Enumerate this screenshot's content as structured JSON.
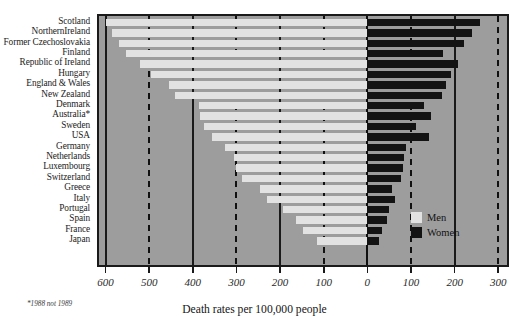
{
  "chart_data": {
    "type": "bar",
    "orientation": "horizontal-diverging",
    "title": "",
    "xlabel": "Death rates per 100,000 people",
    "ylabel": "",
    "footnote": "*1988 not 1989",
    "grid": true,
    "legend_position": "inside-right",
    "axis": {
      "tick_labels": [
        "600",
        "500",
        "400",
        "300",
        "200",
        "100",
        "0",
        "100",
        "200",
        "300"
      ],
      "tick_values": [
        -600,
        -500,
        -400,
        -300,
        -200,
        -100,
        0,
        100,
        200,
        300
      ],
      "xlim": [
        -615,
        320
      ],
      "zero_label": "0"
    },
    "categories": [
      "Scotland",
      "NorthernIreland",
      "Former Czechoslovakia",
      "Finland",
      "Republic of Ireland",
      "Hungary",
      "England & Wales",
      "New Zealand",
      "Denmark",
      "Australia*",
      "Sweden",
      "USA",
      "Germany",
      "Netherlands",
      "Luxembourg",
      "Switzerland",
      "Greece",
      "Italy",
      "Portugal",
      "Spain",
      "France",
      "Japan"
    ],
    "series": [
      {
        "name": "Men",
        "color": "#e2e2e2",
        "side": "left",
        "values": [
          600,
          585,
          570,
          552,
          520,
          495,
          455,
          440,
          385,
          383,
          375,
          357,
          327,
          305,
          300,
          288,
          245,
          230,
          193,
          164,
          148,
          116
        ]
      },
      {
        "name": "Women",
        "color": "#131313",
        "side": "right",
        "values": [
          259,
          239,
          221,
          173,
          207,
          191,
          180,
          170,
          130,
          146,
          111,
          141,
          89,
          84,
          82,
          77,
          57,
          64,
          50,
          45,
          34,
          27
        ]
      }
    ],
    "legend": [
      {
        "label": "Men",
        "color": "#e2e2e2"
      },
      {
        "label": "Women",
        "color": "#131313"
      }
    ]
  },
  "style": {
    "plot_background": "#9d9d9d",
    "frame_color": "#1a1a1a",
    "page_background": "#ffffff"
  }
}
